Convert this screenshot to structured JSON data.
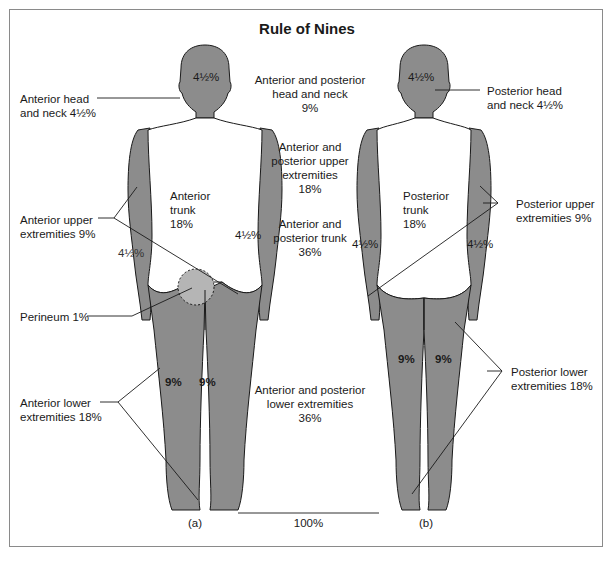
{
  "title": "Rule of Nines",
  "colors": {
    "body_fill": "#8c8c8c",
    "perineum_fill": "#b5b5b5",
    "line": "#1a1a1a",
    "border": "#8a8a8a"
  },
  "figures": {
    "anterior": {
      "caption": "(a)",
      "regions": {
        "head": "4½%",
        "trunk_line1": "Anterior",
        "trunk_line2": "trunk",
        "trunk_value": "18%",
        "left_arm": "4½%",
        "right_arm": "4½%",
        "left_leg": "9%",
        "right_leg": "9%"
      }
    },
    "posterior": {
      "caption": "(b)",
      "regions": {
        "head": "4½%",
        "trunk_line1": "Posterior",
        "trunk_line2": "trunk",
        "trunk_value": "18%",
        "left_arm": "4½%",
        "right_arm": "4½%",
        "left_leg": "9%",
        "right_leg": "9%"
      }
    }
  },
  "left_labels": [
    {
      "line1": "Anterior head",
      "line2": "and neck 4½%"
    },
    {
      "line1": "Anterior upper",
      "line2": "extremities 9%"
    },
    {
      "line1": "Perineum 1%",
      "line2": ""
    },
    {
      "line1": "Anterior lower",
      "line2": "extremities 18%"
    }
  ],
  "right_labels": [
    {
      "line1": "Posterior head",
      "line2": "and neck 4½%"
    },
    {
      "line1": "Posterior upper",
      "line2": "extremities 9%"
    },
    {
      "line1": "Posterior lower",
      "line2": "extremities 18%"
    }
  ],
  "center_labels": [
    {
      "line1": "Anterior and posterior",
      "line2": "head and neck",
      "line3": "9%"
    },
    {
      "line1": "Anterior and",
      "line2": "posterior upper",
      "line3": "extremities",
      "line4": "18%"
    },
    {
      "line1": "Anterior and",
      "line2": "posterior trunk",
      "line3": "36%"
    },
    {
      "line1": "Anterior and posterior",
      "line2": "lower extremities",
      "line3": "36%"
    }
  ],
  "total": "100%"
}
